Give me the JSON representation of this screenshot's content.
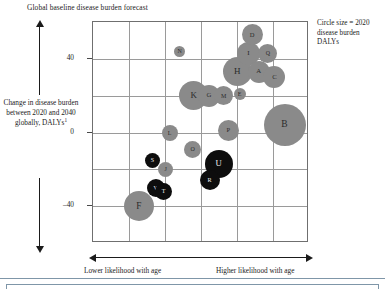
{
  "chart_data": {
    "type": "scatter",
    "title": "Global baseline disease burden forecast",
    "xlabel_low": "Lower likelihood with age",
    "xlabel_high": "Higher likelihood with age",
    "ylabel": "Change in disease burden between 2020 and 2040 globally, DALYs",
    "ylabel_footnote": "1",
    "legend_note": "Circle size = 2020 disease burden DALYs",
    "grid": true,
    "legend_position": "top-right",
    "yticks": [
      {
        "label": "40",
        "value": 40
      },
      {
        "label": "0",
        "value": 0
      },
      {
        "label": "–40",
        "value": -40
      }
    ],
    "ylim": [
      -60,
      60
    ],
    "xlim": [
      0,
      6
    ],
    "size_encoding": "2020 disease burden DALYs",
    "color_categories": [
      {
        "name": "gray",
        "hex": "#8a8a8a"
      },
      {
        "name": "black",
        "hex": "#0d0d0d"
      }
    ],
    "points": [
      {
        "label": "A",
        "x": 4.6,
        "y": 33,
        "r": 11.0,
        "color": "gray"
      },
      {
        "label": "B",
        "x": 5.32,
        "y": 4,
        "r": 21.0,
        "color": "gray"
      },
      {
        "label": "C",
        "x": 5.04,
        "y": 30,
        "r": 11.0,
        "color": "gray"
      },
      {
        "label": "D",
        "x": 4.42,
        "y": 53,
        "r": 10.5,
        "color": "gray"
      },
      {
        "label": "E",
        "x": 4.07,
        "y": 21,
        "r": 6.0,
        "color": "gray"
      },
      {
        "label": "F",
        "x": 1.27,
        "y": -40,
        "r": 15.0,
        "color": "gray"
      },
      {
        "label": "G",
        "x": 3.22,
        "y": 20,
        "r": 11.0,
        "color": "gray"
      },
      {
        "label": "H",
        "x": 4.01,
        "y": 33,
        "r": 14.5,
        "color": "gray"
      },
      {
        "label": "I",
        "x": 4.32,
        "y": 43,
        "r": 11.5,
        "color": "gray"
      },
      {
        "label": "J",
        "x": 2.02,
        "y": -20,
        "r": 7.5,
        "color": "gray"
      },
      {
        "label": "K",
        "x": 2.8,
        "y": 20,
        "r": 14.5,
        "color": "gray"
      },
      {
        "label": "L",
        "x": 2.13,
        "y": 0,
        "r": 8.0,
        "color": "gray"
      },
      {
        "label": "M",
        "x": 3.63,
        "y": 20,
        "r": 9.5,
        "color": "gray"
      },
      {
        "label": "N",
        "x": 2.41,
        "y": 44,
        "r": 5.5,
        "color": "gray"
      },
      {
        "label": "O",
        "x": 2.77,
        "y": -9,
        "r": 8.5,
        "color": "gray"
      },
      {
        "label": "P",
        "x": 3.76,
        "y": 1,
        "r": 10.5,
        "color": "gray"
      },
      {
        "label": "Q",
        "x": 4.86,
        "y": 43,
        "r": 9.5,
        "color": "gray"
      },
      {
        "label": "R",
        "x": 3.24,
        "y": -26,
        "r": 10.0,
        "color": "black"
      },
      {
        "label": "S",
        "x": 1.65,
        "y": -15,
        "r": 7.5,
        "color": "black"
      },
      {
        "label": "T",
        "x": 1.96,
        "y": -32,
        "r": 8.5,
        "color": "black"
      },
      {
        "label": "U",
        "x": 3.49,
        "y": -17,
        "r": 14.0,
        "color": "black"
      },
      {
        "label": "V",
        "x": 1.74,
        "y": -30,
        "r": 9.0,
        "color": "black"
      }
    ]
  }
}
